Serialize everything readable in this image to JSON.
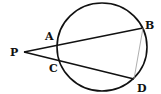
{
  "diagram": {
    "type": "circle-secants",
    "circle": {
      "cx": 102,
      "cy": 47,
      "rx": 45,
      "ry": 44
    },
    "points": {
      "P": {
        "label": "P",
        "x": 24,
        "y": 52
      },
      "A": {
        "label": "A",
        "x": 58,
        "y": 42
      },
      "B": {
        "label": "B",
        "x": 143,
        "y": 28
      },
      "C": {
        "label": "C",
        "x": 60,
        "y": 61
      },
      "D": {
        "label": "D",
        "x": 134,
        "y": 79
      }
    },
    "segments": [
      {
        "from": "P",
        "to": "B",
        "style": "bold"
      },
      {
        "from": "P",
        "to": "D",
        "style": "bold"
      },
      {
        "from": "B",
        "to": "D",
        "style": "thin"
      }
    ]
  }
}
